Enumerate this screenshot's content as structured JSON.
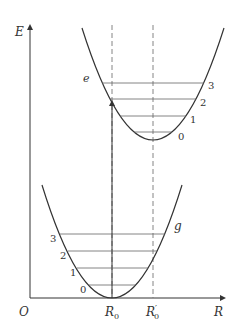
{
  "diagram": {
    "axis": {
      "y_label": "E",
      "x_label": "R",
      "origin_label": "O"
    },
    "markers": {
      "r0_label": "R",
      "r0_sub": "0",
      "r0_prime_label": "R",
      "r0_prime_sub": "0",
      "r0_prime_mark": "′"
    },
    "curves": {
      "ground": {
        "label": "g",
        "levels": [
          "0",
          "1",
          "2",
          "3"
        ]
      },
      "excited": {
        "label": "e",
        "levels": [
          "0",
          "1",
          "2",
          "3"
        ]
      }
    },
    "colors": {
      "line": "#333333",
      "level": "#666666",
      "dashed": "#777777"
    }
  }
}
